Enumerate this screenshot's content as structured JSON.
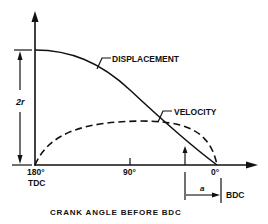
{
  "diagram": {
    "title": "CRANK ANGLE BEFORE BDC",
    "labels": {
      "displacement": "DISPLACEMENT",
      "velocity": "VELOCITY",
      "stroke": "2r",
      "tdc_angle": "180°",
      "tdc": "TDC",
      "mid_angle": "90°",
      "bdc_angle": "0°",
      "bdc": "BDC",
      "a": "a"
    },
    "colors": {
      "ink": "#111111",
      "background": "#ffffff"
    }
  }
}
